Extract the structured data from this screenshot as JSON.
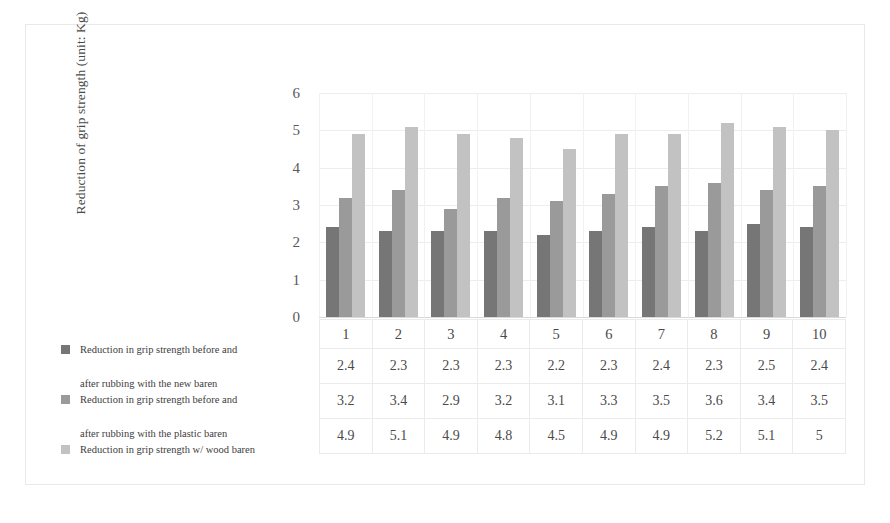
{
  "chart_data": {
    "type": "bar",
    "title": "",
    "subtitle": "",
    "xlabel": "",
    "ylabel": "Reduction of grip strength (unit: Kg)",
    "categories": [
      "1",
      "2",
      "3",
      "4",
      "5",
      "6",
      "7",
      "8",
      "9",
      "10"
    ],
    "ylim": [
      0,
      6
    ],
    "yticks": [
      "0",
      "1",
      "2",
      "3",
      "4",
      "5",
      "6"
    ],
    "grid": true,
    "legend_position": "bottom-left",
    "series": [
      {
        "name": "Reduction in grip strength before and after rubbing with the new baren",
        "name_line1": "Reduction in grip strength before and",
        "name_line2": "after rubbing with the new baren",
        "color": "#767676",
        "values": [
          2.4,
          2.3,
          2.3,
          2.3,
          2.2,
          2.3,
          2.4,
          2.3,
          2.5,
          2.4
        ],
        "labels": [
          "2.4",
          "2.3",
          "2.3",
          "2.3",
          "2.2",
          "2.3",
          "2.4",
          "2.3",
          "2.5",
          "2.4"
        ]
      },
      {
        "name": "Reduction in grip strength before and after rubbing with the plastic baren",
        "name_line1": "Reduction in grip strength before and",
        "name_line2": "after rubbing with the plastic baren",
        "color": "#9a9a9a",
        "values": [
          3.2,
          3.4,
          2.9,
          3.2,
          3.1,
          3.3,
          3.5,
          3.6,
          3.4,
          3.5
        ],
        "labels": [
          "3.2",
          "3.4",
          "2.9",
          "3.2",
          "3.1",
          "3.3",
          "3.5",
          "3.6",
          "3.4",
          "3.5"
        ]
      },
      {
        "name": "Reduction in grip strength w/ wood baren",
        "name_line1": "Reduction in grip strength w/ wood baren",
        "name_line2": "",
        "color": "#c2c2c2",
        "values": [
          4.9,
          5.1,
          4.9,
          4.8,
          4.5,
          4.9,
          4.9,
          5.2,
          5.1,
          5.0
        ],
        "labels": [
          "4.9",
          "5.1",
          "4.9",
          "4.8",
          "4.5",
          "4.9",
          "4.9",
          "5.2",
          "5.1",
          "5"
        ]
      }
    ]
  },
  "colors": {
    "series1": "#767676",
    "series2": "#9a9a9a",
    "series3": "#c2c2c2",
    "gridline": "#ededed",
    "table_border": "#ebebeb",
    "figure_border": "#e9e9e9"
  }
}
